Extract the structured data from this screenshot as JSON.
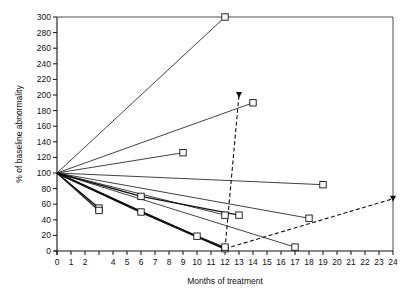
{
  "chart_data": {
    "type": "line",
    "title": "",
    "xlabel": "Months of treatment",
    "ylabel": "% of baseline abnormality",
    "xlim": [
      0,
      24
    ],
    "ylim": [
      0,
      300
    ],
    "x_ticks": [
      0,
      1,
      2,
      4,
      5,
      6,
      7,
      8,
      9,
      10,
      11,
      12,
      13,
      14,
      15,
      16,
      17,
      18,
      19,
      20,
      21,
      22,
      23,
      24
    ],
    "x_tick_marks": [
      0,
      1,
      2,
      3,
      4,
      5,
      6,
      7,
      8,
      9,
      10,
      11,
      12,
      13,
      14,
      15,
      16,
      17,
      18,
      19,
      20,
      21,
      22,
      23,
      24
    ],
    "y_ticks": [
      0,
      20,
      40,
      60,
      80,
      100,
      120,
      140,
      160,
      180,
      200,
      220,
      240,
      260,
      280,
      300
    ],
    "grid": false,
    "frame": "top-and-right border lines present",
    "legend": null,
    "series": [
      {
        "name": "patient-1",
        "style": "thin",
        "marker": "square",
        "points": [
          [
            0,
            100
          ],
          [
            12,
            300
          ]
        ]
      },
      {
        "name": "patient-2",
        "style": "thin",
        "marker": "square",
        "points": [
          [
            0,
            100
          ],
          [
            14,
            190
          ]
        ]
      },
      {
        "name": "patient-3",
        "style": "thin",
        "marker": "square",
        "points": [
          [
            0,
            100
          ],
          [
            9,
            126
          ]
        ]
      },
      {
        "name": "patient-4",
        "style": "thin",
        "marker": "square",
        "points": [
          [
            0,
            100
          ],
          [
            19,
            85
          ]
        ]
      },
      {
        "name": "patient-5",
        "style": "thin",
        "marker": "square",
        "points": [
          [
            0,
            100
          ],
          [
            18,
            42
          ]
        ]
      },
      {
        "name": "patient-6",
        "style": "thin",
        "marker": "square",
        "points": [
          [
            0,
            100
          ],
          [
            17,
            5
          ]
        ]
      },
      {
        "name": "patient-7",
        "style": "medium",
        "marker": "square",
        "points": [
          [
            0,
            100
          ],
          [
            6,
            70
          ],
          [
            13,
            46
          ]
        ]
      },
      {
        "name": "patient-8",
        "style": "thin",
        "marker": "square",
        "points": [
          [
            0,
            100
          ],
          [
            12,
            46
          ]
        ]
      },
      {
        "name": "patient-9",
        "style": "medium",
        "marker": "square",
        "points": [
          [
            0,
            100
          ],
          [
            3,
            55
          ]
        ]
      },
      {
        "name": "patient-10",
        "style": "medium",
        "marker": "square",
        "points": [
          [
            0,
            100
          ],
          [
            3,
            52
          ]
        ]
      },
      {
        "name": "patient-11",
        "style": "thick",
        "marker": "square",
        "points": [
          [
            0,
            100
          ],
          [
            6,
            50
          ],
          [
            12,
            3
          ]
        ]
      },
      {
        "name": "patient-12",
        "style": "thin",
        "marker": "square",
        "points": [
          [
            0,
            100
          ],
          [
            10,
            19
          ],
          [
            12,
            5
          ]
        ]
      },
      {
        "name": "relapse-1",
        "style": "dashed",
        "marker": "triangle-down",
        "points": [
          [
            12,
            3
          ],
          [
            13,
            200
          ]
        ]
      },
      {
        "name": "relapse-2",
        "style": "dashed",
        "marker": "triangle-down",
        "points": [
          [
            12,
            3
          ],
          [
            24,
            67
          ]
        ]
      }
    ]
  }
}
